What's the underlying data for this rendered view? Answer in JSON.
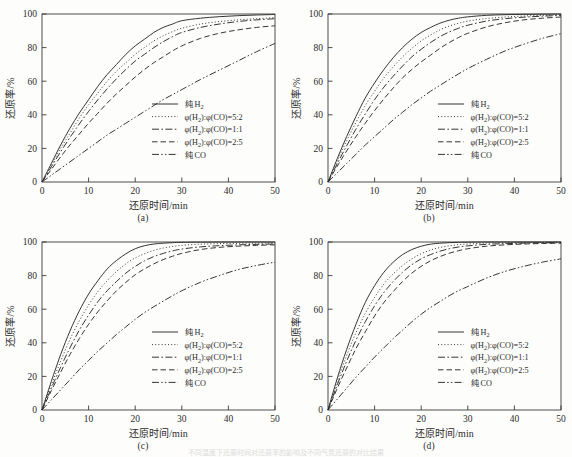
{
  "figure": {
    "panels": [
      "(a)",
      "(b)",
      "(c)",
      "(d)"
    ],
    "bottom_caption": "不同温度下还原时间对还原率的影响及不同气氛还原的对比结果"
  },
  "axes": {
    "xlabel": "还原时间/min",
    "ylabel": "还原率/%",
    "xticks": [
      "0",
      "10",
      "20",
      "30",
      "40",
      "50"
    ],
    "yticks": [
      "0",
      "20",
      "40",
      "60",
      "80",
      "100"
    ],
    "xlim": [
      0,
      50
    ],
    "ylim": [
      0,
      100
    ]
  },
  "legend": {
    "entries": [
      {
        "label": "纯 H",
        "sub": "2",
        "style": "solid"
      },
      {
        "label": "φ(H",
        "sub": "2",
        "label2": "):φ(CO)=5:2",
        "style": "dotted"
      },
      {
        "label": "φ(H",
        "sub": "2",
        "label2": "):φ(CO)=1:1",
        "style": "dashdot"
      },
      {
        "label": "φ(H",
        "sub": "2",
        "label2": "):φ(CO)=2:5",
        "style": "dashed"
      },
      {
        "label": "纯 CO",
        "sub": "",
        "style": "dashdotdot"
      }
    ]
  },
  "chart_data": {
    "type": "line",
    "title": "",
    "xlabel": "还原时间/min",
    "ylabel": "还原率/%",
    "xlim": [
      0,
      50
    ],
    "ylim": [
      0,
      100
    ],
    "grid": false,
    "legend_position": "lower-right-inside",
    "x": [
      0,
      2,
      4,
      6,
      8,
      10,
      12,
      14,
      16,
      18,
      20,
      22,
      24,
      26,
      28,
      30,
      34,
      38,
      42,
      46,
      50
    ],
    "panels": [
      {
        "label": "(a)",
        "series": [
          {
            "name": "纯 H2",
            "style": "solid",
            "values": [
              0,
              11,
              22,
              32,
              41,
              49,
              57,
              64,
              70,
              76,
              81,
              85,
              89,
              92,
              94,
              96,
              97.5,
              98.4,
              99,
              99.4,
              99.7
            ]
          },
          {
            "name": "φ(H2):φ(CO)=5:2",
            "style": "dotted",
            "values": [
              0,
              10,
              20,
              29,
              38,
              46,
              53,
              60,
              66,
              71,
              76,
              80,
              84,
              87,
              89.5,
              91.5,
              94,
              95.5,
              96.5,
              97.2,
              97.8
            ]
          },
          {
            "name": "φ(H2):φ(CO)=1:1",
            "style": "dashdot",
            "values": [
              0,
              9,
              18,
              26.5,
              34.5,
              42,
              49,
              55.5,
              61.5,
              67,
              72,
              76,
              80,
              83.5,
              86.5,
              89,
              92,
              94,
              95.5,
              96.5,
              97.2
            ]
          },
          {
            "name": "φ(H2):φ(CO)=2:5",
            "style": "dashed",
            "values": [
              0,
              7.5,
              15,
              22,
              28.5,
              35,
              41,
              47,
              52.5,
              57.5,
              62.5,
              67,
              71,
              74.5,
              78,
              81,
              85.5,
              88.5,
              90.5,
              92,
              93
            ]
          },
          {
            "name": "纯 CO",
            "style": "dashdotdot",
            "values": [
              0,
              4,
              8,
              12,
              16,
              20,
              24,
              28,
              31.5,
              35,
              38.5,
              42,
              45.5,
              49,
              52,
              55,
              61,
              66.5,
              72,
              77.5,
              82.5
            ]
          }
        ]
      },
      {
        "label": "(b)",
        "series": [
          {
            "name": "纯 H2",
            "style": "solid",
            "values": [
              0,
              14,
              27,
              39,
              50,
              59,
              67,
              74,
              80,
              85,
              89,
              92,
              94.5,
              96.3,
              97.5,
              98.3,
              99.2,
              99.6,
              99.8,
              99.9,
              100
            ]
          },
          {
            "name": "φ(H2):φ(CO)=5:2",
            "style": "dotted",
            "values": [
              0,
              12.5,
              24.5,
              35.5,
              45.5,
              54,
              62,
              68.5,
              74.5,
              79.5,
              84,
              87.5,
              90.5,
              92.8,
              94.5,
              95.8,
              97.3,
              98.2,
              98.8,
              99.2,
              99.5
            ]
          },
          {
            "name": "φ(H2):φ(CO)=1:1",
            "style": "dashdot",
            "values": [
              0,
              11,
              21.5,
              31.5,
              40.5,
              49,
              56.5,
              63,
              69,
              74.5,
              79,
              83,
              86.5,
              89.3,
              91.5,
              93.3,
              95.8,
              97.2,
              98.1,
              98.7,
              99.1
            ]
          },
          {
            "name": "φ(H2):φ(CO)=2:5",
            "style": "dashed",
            "values": [
              0,
              9.5,
              18.5,
              27,
              35,
              42.5,
              49.5,
              56,
              62,
              67,
              71.5,
              75.5,
              79.5,
              83,
              86,
              88.5,
              92.3,
              94.8,
              96.5,
              97.5,
              98.2
            ]
          },
          {
            "name": "纯 CO",
            "style": "dashdotdot",
            "values": [
              0,
              5.5,
              11,
              16.5,
              22,
              27,
              32,
              37,
              41.5,
              46,
              50,
              54,
              57.5,
              61,
              64.3,
              67.5,
              73,
              78,
              82,
              85.5,
              88.3
            ]
          }
        ]
      },
      {
        "label": "(c)",
        "series": [
          {
            "name": "纯 H2",
            "style": "solid",
            "values": [
              0,
              17,
              33,
              47,
              59,
              69,
              77,
              84,
              89,
              93,
              96,
              97.8,
              98.8,
              99.3,
              99.6,
              99.8,
              99.9,
              100,
              100,
              100,
              100
            ]
          },
          {
            "name": "φ(H2):φ(CO)=5:2",
            "style": "dotted",
            "values": [
              0,
              15,
              29,
              42,
              53,
              62.5,
              70.5,
              77,
              82.5,
              87,
              90.5,
              93,
              95,
              96.4,
              97.3,
              98,
              98.7,
              99,
              99.2,
              99.3,
              99.4
            ]
          },
          {
            "name": "φ(H2):φ(CO)=1:1",
            "style": "dashdot",
            "values": [
              0,
              13,
              25.5,
              37,
              47.5,
              56.5,
              64.5,
              71,
              76.5,
              81.5,
              85.5,
              88.8,
              91.3,
              93.2,
              94.7,
              95.8,
              97.1,
              97.8,
              98.3,
              98.6,
              98.8
            ]
          },
          {
            "name": "φ(H2):φ(CO)=2:5",
            "style": "dashed",
            "values": [
              0,
              11.5,
              22.5,
              33,
              42.5,
              51,
              58.5,
              65,
              71,
              76,
              80.5,
              84,
              87,
              89.5,
              91.5,
              93.2,
              95.5,
              96.8,
              97.5,
              98,
              98.3
            ]
          },
          {
            "name": "纯 CO",
            "style": "dashdotdot",
            "values": [
              0,
              6,
              12,
              18,
              24,
              29.5,
              35,
              40,
              45,
              49.5,
              54,
              58,
              61.5,
              64.8,
              68,
              71,
              76,
              80,
              83.5,
              86,
              88
            ]
          }
        ]
      },
      {
        "label": "(d)",
        "series": [
          {
            "name": "纯 H2",
            "style": "solid",
            "values": [
              0,
              19,
              36,
              51,
              64,
              74,
              82,
              88,
              92.5,
              95.5,
              97.5,
              98.7,
              99.3,
              99.6,
              99.8,
              99.9,
              100,
              100,
              100,
              100,
              100
            ]
          },
          {
            "name": "φ(H2):φ(CO)=5:2",
            "style": "dotted",
            "values": [
              0,
              17,
              32.5,
              46,
              57.5,
              67,
              75,
              81,
              86,
              90,
              93,
              95.2,
              96.7,
              97.7,
              98.4,
              98.8,
              99.3,
              99.5,
              99.6,
              99.7,
              99.8
            ]
          },
          {
            "name": "φ(H2):φ(CO)=1:1",
            "style": "dashdot",
            "values": [
              0,
              15,
              29,
              41.5,
              52.5,
              62,
              70,
              76.5,
              82,
              86.5,
              90,
              92.5,
              94.5,
              96,
              97,
              97.7,
              98.6,
              99,
              99.3,
              99.5,
              99.6
            ]
          },
          {
            "name": "φ(H2):φ(CO)=2:5",
            "style": "dashed",
            "values": [
              0,
              13,
              25,
              36.5,
              46.5,
              56,
              64,
              70.5,
              76.5,
              81.5,
              85.5,
              88.8,
              91.3,
              93.3,
              94.8,
              96,
              97.5,
              98.3,
              98.8,
              99.1,
              99.3
            ]
          },
          {
            "name": "纯 CO",
            "style": "dashdotdot",
            "values": [
              0,
              6.5,
              13,
              19.5,
              25.5,
              31.5,
              37,
              42.5,
              47.5,
              52.5,
              57,
              61,
              64.5,
              68,
              71,
              73.5,
              78.5,
              82.5,
              85.5,
              88,
              90
            ]
          }
        ]
      }
    ]
  }
}
